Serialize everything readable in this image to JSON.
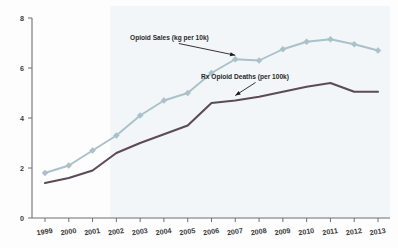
{
  "chart_data": {
    "type": "line",
    "title": "",
    "subtitle": "",
    "xlabel": "",
    "ylabel": "",
    "x": [
      "1999",
      "2000",
      "2001",
      "2002",
      "2003",
      "2004",
      "2005",
      "2006",
      "2007",
      "2008",
      "2009",
      "2010",
      "2011",
      "2012",
      "2013"
    ],
    "categories": [
      "1999",
      "2000",
      "2001",
      "2002",
      "2003",
      "2004",
      "2005",
      "2006",
      "2007",
      "2008",
      "2009",
      "2010",
      "2011",
      "2012",
      "2013"
    ],
    "xlim": [
      1999,
      2013
    ],
    "ylim": [
      0,
      8
    ],
    "yticks": [
      "0",
      "2",
      "4",
      "6",
      "8"
    ],
    "ytick_values": [
      0,
      2,
      4,
      6,
      8
    ],
    "grid": false,
    "legend_position": "inline-annotation",
    "series": [
      {
        "name": "Opioid Sales (kg per 10k)",
        "color": "#a9c1c9",
        "marker": "diamond",
        "values": [
          1.8,
          2.1,
          2.7,
          3.3,
          4.1,
          4.7,
          5.0,
          5.8,
          6.35,
          6.3,
          6.75,
          7.05,
          7.15,
          6.95,
          6.7
        ]
      },
      {
        "name": "Rx Opioid Deaths (per 100k)",
        "color": "#5c4b57",
        "marker": "none",
        "values": [
          1.4,
          1.6,
          1.9,
          2.6,
          3.0,
          3.35,
          3.7,
          4.6,
          4.7,
          4.85,
          5.05,
          5.25,
          5.4,
          5.05,
          5.05
        ]
      }
    ],
    "annotations": [
      {
        "text": "Opioid Sales (kg per 10k)",
        "target_series": "Opioid Sales (kg per 10k)",
        "target_x": "2007"
      },
      {
        "text": "Rx Opioid Deaths (per 100k)",
        "target_series": "Rx Opioid Deaths (per 100k)",
        "target_x": "2007"
      }
    ],
    "shaded_band": {
      "from_x": "2002",
      "to_x": "2013",
      "color": "#f2f6f8"
    }
  }
}
